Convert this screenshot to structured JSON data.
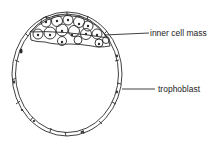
{
  "diagram": {
    "labels": {
      "inner_cell_mass": "inner cell mass",
      "trophoblast": "trophoblast"
    },
    "colors": {
      "stroke": "#2a2a2a",
      "background": "#ffffff",
      "text": "#222222"
    }
  }
}
